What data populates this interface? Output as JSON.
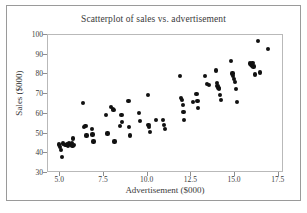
{
  "chart_data": {
    "type": "scatter",
    "title": "Scatterplot of sales vs. advertisement",
    "xlabel": "Advertisement ($000)",
    "ylabel": "Sales ($000)",
    "xlim": [
      4.3,
      17.8
    ],
    "ylim": [
      30,
      100
    ],
    "xticks": [
      "5.0",
      "7.5",
      "10.0",
      "12.5",
      "15.0",
      "17.5"
    ],
    "xtick_values": [
      5.0,
      7.5,
      10.0,
      12.5,
      15.0,
      17.5
    ],
    "yticks": [
      "30",
      "40",
      "50",
      "60",
      "70",
      "80",
      "90",
      "100"
    ],
    "ytick_values": [
      30,
      40,
      50,
      60,
      70,
      80,
      90,
      100
    ],
    "grid": false,
    "legend": null,
    "marker_color": "#111111",
    "series": [
      {
        "name": "sales vs advertisement",
        "x": [
          4.95,
          5.0,
          5.05,
          5.1,
          5.15,
          5.3,
          5.4,
          5.45,
          5.5,
          5.55,
          5.6,
          5.65,
          5.7,
          5.75,
          5.8,
          6.3,
          6.35,
          6.45,
          6.5,
          6.8,
          6.85,
          6.9,
          7.6,
          7.7,
          7.9,
          8.0,
          8.05,
          8.1,
          8.4,
          8.5,
          8.55,
          8.9,
          8.95,
          9.0,
          9.5,
          9.55,
          10.0,
          10.05,
          10.1,
          10.15,
          10.5,
          10.9,
          10.95,
          11.0,
          11.85,
          11.9,
          11.95,
          12.0,
          12.05,
          12.1,
          12.6,
          12.8,
          12.85,
          12.9,
          13.3,
          13.4,
          13.5,
          13.9,
          13.95,
          14.0,
          14.05,
          14.1,
          14.15,
          14.2,
          14.75,
          14.85,
          14.9,
          14.95,
          15.0,
          15.05,
          15.1,
          15.85,
          15.9,
          15.95,
          16.0,
          16.05,
          16.15,
          16.3,
          16.45,
          16.9
        ],
        "y": [
          44.5,
          43.0,
          41.5,
          38.0,
          45.0,
          44.0,
          44.5,
          43.5,
          45.0,
          44.8,
          44.2,
          45.2,
          43.8,
          47.5,
          44.0,
          65.5,
          53.5,
          54.0,
          49.0,
          52.5,
          49.5,
          46.0,
          59.5,
          50.0,
          63.5,
          62.5,
          62.0,
          46.0,
          54.0,
          59.5,
          56.0,
          66.5,
          53.5,
          49.0,
          60.5,
          56.5,
          69.5,
          54.5,
          53.5,
          51.0,
          57.0,
          57.0,
          54.5,
          52.5,
          79.0,
          68.0,
          67.0,
          64.5,
          61.0,
          57.0,
          66.0,
          70.0,
          66.5,
          63.0,
          79.0,
          75.0,
          74.5,
          82.0,
          75.5,
          74.0,
          73.0,
          72.5,
          69.5,
          67.0,
          87.0,
          80.5,
          79.0,
          77.5,
          76.0,
          72.5,
          66.0,
          85.5,
          85.0,
          84.5,
          86.0,
          84.0,
          80.0,
          97.0,
          81.0,
          93.0
        ]
      }
    ]
  }
}
